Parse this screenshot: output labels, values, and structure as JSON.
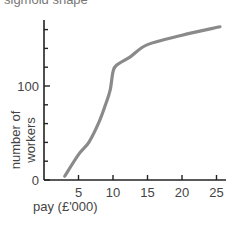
{
  "title": "sigmoid shape",
  "chart_data": {
    "type": "line",
    "title": "sigmoid shape",
    "xlabel": "pay (£'000)",
    "ylabel": "number of workers",
    "x_ticks": [
      5,
      10,
      15,
      20,
      25
    ],
    "y_tick_labels": [
      0,
      100
    ],
    "y_minor_ticks": [
      20,
      40,
      60,
      80,
      120,
      140,
      160
    ],
    "xlim": [
      0,
      26
    ],
    "ylim": [
      0,
      170
    ],
    "grid": false,
    "series": [
      {
        "name": "number of workers",
        "color": "#8a8a8a",
        "x": [
          3,
          5,
          6.5,
          8,
          9,
          9.6,
          10,
          10.5,
          12.5,
          15,
          20,
          25.5
        ],
        "y": [
          4,
          27,
          40,
          62,
          82,
          96,
          115,
          122,
          131,
          144,
          154,
          163
        ]
      }
    ]
  }
}
